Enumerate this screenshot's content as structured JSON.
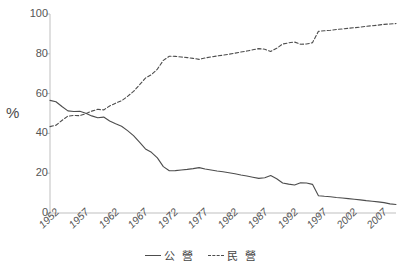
{
  "chart_data": {
    "type": "line",
    "title": "",
    "xlabel": "",
    "ylabel": "%",
    "ylim": [
      0,
      100
    ],
    "xlim": [
      1952,
      2010
    ],
    "yticks": [
      0,
      20,
      40,
      60,
      80,
      100
    ],
    "xticks": [
      1952,
      1957,
      1962,
      1967,
      1972,
      1977,
      1982,
      1987,
      1992,
      1997,
      2002,
      2007
    ],
    "grid": false,
    "legend_position": "bottom",
    "x": [
      1952,
      1953,
      1954,
      1955,
      1956,
      1957,
      1958,
      1959,
      1960,
      1961,
      1962,
      1963,
      1964,
      1965,
      1966,
      1967,
      1968,
      1969,
      1970,
      1971,
      1972,
      1973,
      1974,
      1975,
      1976,
      1977,
      1978,
      1979,
      1980,
      1981,
      1982,
      1983,
      1984,
      1985,
      1986,
      1987,
      1988,
      1989,
      1990,
      1991,
      1992,
      1993,
      1994,
      1995,
      1996,
      1997,
      1998,
      1999,
      2000,
      2001,
      2002,
      2003,
      2004,
      2005,
      2006,
      2007,
      2008,
      2009,
      2010
    ],
    "series": [
      {
        "name": "公  營",
        "style": "solid",
        "color": "#4d4d4d",
        "values": [
          56.6,
          55.9,
          53.5,
          51.3,
          51.0,
          51.1,
          50.1,
          48.8,
          47.9,
          48.2,
          46.2,
          44.8,
          43.6,
          41.4,
          38.9,
          35.6,
          32.2,
          30.5,
          27.7,
          23.3,
          21.2,
          21.3,
          21.6,
          21.9,
          22.3,
          22.8,
          22.1,
          21.6,
          21.1,
          20.7,
          20.2,
          19.7,
          19.1,
          18.6,
          18.0,
          17.4,
          17.7,
          18.8,
          17.2,
          15.1,
          14.5,
          14.1,
          15.2,
          15.1,
          14.4,
          8.7,
          8.4,
          8.2,
          7.8,
          7.5,
          7.2,
          6.9,
          6.6,
          6.2,
          5.9,
          5.6,
          5.2,
          4.6,
          4.3
        ]
      },
      {
        "name": "民  營",
        "style": "dashed",
        "color": "#4d4d4d",
        "values": [
          43.4,
          44.1,
          46.5,
          48.7,
          49.0,
          48.9,
          49.9,
          51.2,
          52.1,
          51.8,
          53.8,
          55.2,
          56.4,
          58.6,
          61.1,
          64.4,
          67.8,
          69.5,
          72.3,
          76.7,
          78.8,
          78.7,
          78.4,
          78.1,
          77.7,
          77.2,
          77.9,
          78.4,
          78.9,
          79.3,
          79.8,
          80.3,
          80.9,
          81.4,
          82.0,
          82.6,
          82.3,
          81.2,
          82.8,
          84.9,
          85.5,
          85.9,
          84.8,
          84.9,
          85.6,
          91.3,
          91.6,
          91.8,
          92.2,
          92.5,
          92.8,
          93.1,
          93.4,
          93.8,
          94.1,
          94.4,
          94.8,
          95.0,
          95.2
        ]
      }
    ]
  },
  "legend": {
    "items": [
      {
        "label": "公  營",
        "style": "solid"
      },
      {
        "label": "民  營",
        "style": "dashed"
      }
    ]
  },
  "axes": {
    "y_axis_title": "%",
    "y_tick_labels": [
      "100",
      "80",
      "60",
      "40",
      "20",
      "0"
    ],
    "x_tick_labels": [
      "1952",
      "1957",
      "1962",
      "1967",
      "1972",
      "1977",
      "1982",
      "1987",
      "1992",
      "1997",
      "2002",
      "2007"
    ]
  },
  "colors": {
    "line": "#4d4d4d",
    "axis": "#bfbfbf",
    "text": "#555555",
    "background": "#ffffff"
  }
}
